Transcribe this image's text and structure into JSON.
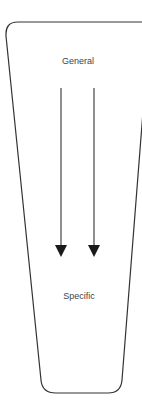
{
  "diagram": {
    "top_label": "General",
    "bottom_label": "Specific",
    "colors": {
      "stroke": "#333333",
      "text": "#444444",
      "arrow": "#1a1a1a"
    }
  }
}
